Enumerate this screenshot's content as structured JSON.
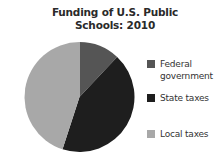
{
  "chart_data": {
    "type": "pie",
    "title": "Funding of U.S. Public Schools: 2010",
    "categories": [
      "Federal government",
      "State taxes",
      "Local taxes"
    ],
    "values": [
      12,
      43,
      45
    ],
    "unit": "percent (estimated from slice angles)",
    "colors": [
      "#555555",
      "#1e1e1e",
      "#a8a8a8"
    ],
    "start_angle": "12 o'clock",
    "direction": "clockwise",
    "legend_position": "right"
  },
  "title_line1": "Funding of U.S. Public",
  "title_line2": "Schools: 2010",
  "legend": [
    {
      "label": "Federal government",
      "color": "#555555"
    },
    {
      "label": "State taxes",
      "color": "#1e1e1e"
    },
    {
      "label": "Local taxes",
      "color": "#a8a8a8"
    }
  ]
}
